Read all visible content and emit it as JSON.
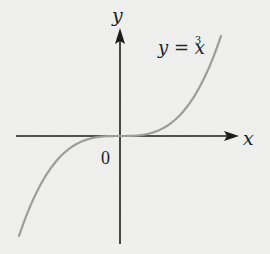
{
  "chart_data": {
    "type": "line",
    "title": "",
    "xlabel": "x",
    "ylabel": "y",
    "origin_label": "0",
    "series": [
      {
        "name": "y = x^3",
        "label_text": "y = x",
        "label_superscript": "3",
        "function": "x^3",
        "x": [
          -1.0,
          -0.75,
          -0.5,
          -0.25,
          0,
          0.25,
          0.5,
          0.75,
          1.0
        ],
        "values": [
          -1.0,
          -0.421875,
          -0.125,
          -0.015625,
          0,
          0.015625,
          0.125,
          0.421875,
          1.0
        ]
      }
    ],
    "xlim": [
      -1.05,
      1.25
    ],
    "ylim": [
      -1.08,
      1.05
    ],
    "grid": false,
    "legend": "none",
    "tick_labels": false,
    "colors": {
      "axis": "#1a1a1a",
      "curve": "#9a9a9a",
      "background": "#f1f1f0"
    }
  }
}
